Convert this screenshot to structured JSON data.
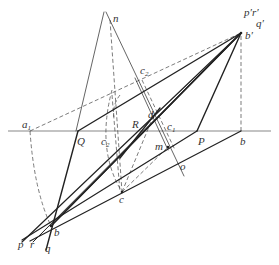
{
  "diagram": {
    "title": "",
    "colors": {
      "stroke": "#222222",
      "dashed": "#444444",
      "background": "#ffffff"
    },
    "baseline": {
      "x1": 8,
      "y1": 131,
      "x2": 271,
      "y2": 131
    },
    "points": {
      "b_prime": {
        "x": 241,
        "y": 33
      },
      "b_low": {
        "x": 51,
        "y": 226
      },
      "n": {
        "x": 110,
        "y": 20
      },
      "a1": {
        "x": 30,
        "y": 131
      },
      "Q": {
        "x": 78,
        "y": 131
      },
      "P": {
        "x": 197,
        "y": 131
      },
      "b_base": {
        "x": 241,
        "y": 131
      },
      "c2_top": {
        "x": 140,
        "y": 75
      },
      "d": {
        "x": 153,
        "y": 117
      },
      "m": {
        "x": 168,
        "y": 147
      },
      "o": {
        "x": 182,
        "y": 166
      },
      "c": {
        "x": 122,
        "y": 192
      }
    },
    "labels": [
      {
        "id": "n",
        "text": "n",
        "sub": "",
        "x": 113,
        "y": 22
      },
      {
        "id": "p_prime_r_prime",
        "text": "p′r′",
        "sub": "",
        "x": 244,
        "y": 16
      },
      {
        "id": "q_prime",
        "text": "q′",
        "sub": "",
        "x": 256,
        "y": 27
      },
      {
        "id": "b_prime",
        "text": "b′",
        "sub": "",
        "x": 245,
        "y": 39
      },
      {
        "id": "c2_top",
        "text": "c",
        "sub": "2",
        "x": 140,
        "y": 74
      },
      {
        "id": "a1",
        "text": "a",
        "sub": "1",
        "x": 22,
        "y": 128
      },
      {
        "id": "Q",
        "text": "Q",
        "sub": "",
        "x": 77,
        "y": 145
      },
      {
        "id": "c2_low",
        "text": "c",
        "sub": "2",
        "x": 101,
        "y": 145
      },
      {
        "id": "R",
        "text": "R",
        "sub": "",
        "x": 132,
        "y": 128
      },
      {
        "id": "d",
        "text": "d",
        "sub": "",
        "x": 148,
        "y": 118
      },
      {
        "id": "c1",
        "text": "c",
        "sub": "1",
        "x": 167,
        "y": 130
      },
      {
        "id": "P",
        "text": "P",
        "sub": "",
        "x": 198,
        "y": 145
      },
      {
        "id": "b_base",
        "text": "b",
        "sub": "",
        "x": 240,
        "y": 145
      },
      {
        "id": "m",
        "text": "m",
        "sub": "",
        "x": 155,
        "y": 150
      },
      {
        "id": "o",
        "text": "o",
        "sub": "",
        "x": 180,
        "y": 170
      },
      {
        "id": "c",
        "text": "c",
        "sub": "",
        "x": 119,
        "y": 203
      },
      {
        "id": "b_low",
        "text": "b",
        "sub": "",
        "x": 54,
        "y": 236
      },
      {
        "id": "p",
        "text": "p",
        "sub": "",
        "x": 18,
        "y": 248
      },
      {
        "id": "r",
        "text": "r",
        "sub": "",
        "x": 30,
        "y": 248
      },
      {
        "id": "q",
        "text": "q",
        "sub": "",
        "x": 45,
        "y": 252
      }
    ],
    "solid_lines": [
      {
        "name": "line-b-bprime-main",
        "x1": 51,
        "y1": 226,
        "x2": 241,
        "y2": 33,
        "w": 1.4
      },
      {
        "name": "line-b-bprime-lower",
        "x1": 51,
        "y1": 226,
        "x2": 241,
        "y2": 33,
        "w": 1.2
      },
      {
        "name": "line-Q-bprime",
        "x1": 78,
        "y1": 131,
        "x2": 241,
        "y2": 33,
        "w": 1.4
      },
      {
        "name": "line-P-bprime",
        "x1": 197,
        "y1": 131,
        "x2": 241,
        "y2": 33,
        "w": 1.4
      },
      {
        "name": "line-b-Q-extended",
        "x1": 46,
        "y1": 250,
        "x2": 78,
        "y2": 131,
        "w": 1.4
      },
      {
        "name": "line-p-through-b",
        "x1": 22,
        "y1": 242,
        "x2": 241,
        "y2": 33,
        "w": 1.2
      },
      {
        "name": "line-b-to-P",
        "x1": 22,
        "y1": 240,
        "x2": 197,
        "y2": 131,
        "w": 1.2
      },
      {
        "name": "line-b-to-bbase",
        "x1": 30,
        "y1": 241,
        "x2": 241,
        "y2": 131,
        "w": 1.2
      },
      {
        "name": "line-r-through-b",
        "x1": 33,
        "y1": 242,
        "x2": 241,
        "y2": 33,
        "w": 1.0
      },
      {
        "name": "line-n-left",
        "x1": 104,
        "y1": 12,
        "x2": 76,
        "y2": 131,
        "w": 0.7
      },
      {
        "name": "line-n-right",
        "x1": 106,
        "y1": 12,
        "x2": 184,
        "y2": 176,
        "w": 0.7
      },
      {
        "name": "line-c2-c1-a",
        "x1": 135,
        "y1": 78,
        "x2": 168,
        "y2": 150,
        "w": 0.7
      },
      {
        "name": "line-R-d-thick",
        "x1": 120,
        "y1": 158,
        "x2": 160,
        "y2": 108,
        "w": 1.4
      }
    ],
    "dashed_lines": [
      {
        "name": "dash-a1-bprime",
        "x1": 30,
        "y1": 131,
        "x2": 241,
        "y2": 33
      },
      {
        "name": "dash-n-c",
        "x1": 110,
        "y1": 20,
        "x2": 122,
        "y2": 192
      },
      {
        "name": "dash-bprime-vertical",
        "x1": 241,
        "y1": 36,
        "x2": 241,
        "y2": 131
      },
      {
        "name": "dash-c2-c1",
        "x1": 142,
        "y1": 80,
        "x2": 175,
        "y2": 150
      },
      {
        "name": "dash-c-to-m",
        "x1": 122,
        "y1": 192,
        "x2": 168,
        "y2": 147
      },
      {
        "name": "dash-c-to-d",
        "x1": 122,
        "y1": 192,
        "x2": 153,
        "y2": 117
      },
      {
        "name": "dash-c2-low-vertical",
        "x1": 112,
        "y1": 95,
        "x2": 120,
        "y2": 192
      }
    ],
    "dashed_arcs": [
      {
        "name": "arc-a1-to-b",
        "d": "M 30 131 Q 34 190 51 226"
      },
      {
        "name": "arc-c2-to-c",
        "d": "M 112 90 Q 96 150 122 192"
      },
      {
        "name": "arc-c2-small",
        "d": "M 120 95 Q 112 105 114 118"
      }
    ],
    "point_marks": [
      {
        "name": "dot-b-low",
        "x": 51,
        "y": 226
      },
      {
        "name": "dot-b-prime",
        "x": 241,
        "y": 33
      },
      {
        "name": "dot-c",
        "x": 122,
        "y": 192
      },
      {
        "name": "dot-d",
        "x": 153,
        "y": 117
      },
      {
        "name": "dot-m",
        "x": 168,
        "y": 147
      }
    ]
  }
}
